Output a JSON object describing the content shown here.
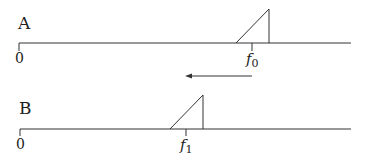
{
  "diagram": {
    "panels": [
      {
        "id": "A",
        "label": "A",
        "origin_label": "0",
        "freq_label_base": "f",
        "freq_label_sub": "0"
      },
      {
        "id": "B",
        "label": "B",
        "origin_label": "0",
        "freq_label_base": "f",
        "freq_label_sub": "1"
      }
    ],
    "shift_arrow": {
      "direction": "left"
    },
    "stroke_color": "#333333"
  }
}
